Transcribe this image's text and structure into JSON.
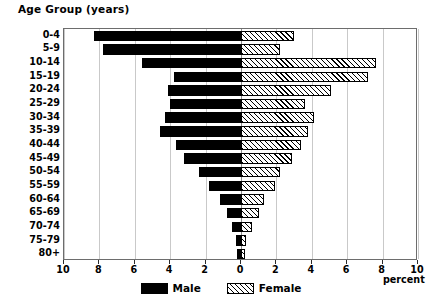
{
  "chart_data": {
    "type": "bar",
    "subtype": "population-pyramid",
    "title": "Age Group (years)",
    "xlabel": "percent",
    "ylabel": "Age Group (years)",
    "grid": true,
    "legend_position": "bottom-center",
    "x_axis": {
      "tick_labels": [
        "10",
        "8",
        "6",
        "4",
        "2",
        "0",
        "2",
        "4",
        "6",
        "8",
        "10"
      ],
      "tick_values": [
        -10,
        -8,
        -6,
        -4,
        -2,
        0,
        2,
        4,
        6,
        8,
        10
      ],
      "min": -10,
      "max": 10,
      "unit": "percent"
    },
    "categories": [
      "80+",
      "75-79",
      "70-74",
      "65-69",
      "60-64",
      "55-59",
      "50-54",
      "45-49",
      "40-44",
      "35-39",
      "30-34",
      "25-29",
      "20-24",
      "15-19",
      "10-14",
      "5-9",
      "0-4"
    ],
    "series": [
      {
        "name": "Male",
        "color": "#000000",
        "fill": "solid-black",
        "values": [
          0.2,
          0.3,
          0.5,
          0.8,
          1.2,
          1.8,
          2.4,
          3.2,
          3.7,
          4.6,
          4.3,
          4.0,
          4.1,
          3.8,
          5.6,
          7.8,
          8.3
        ]
      },
      {
        "name": "Female",
        "color": "#000000",
        "fill": "diagonal-hatch",
        "values": [
          0.2,
          0.3,
          0.6,
          1.0,
          1.3,
          1.9,
          2.2,
          2.9,
          3.4,
          3.8,
          4.1,
          3.6,
          5.1,
          7.2,
          7.6,
          2.2,
          3.0
        ]
      }
    ]
  },
  "chart": {
    "title": "Age Group (years)",
    "x_axis_title": "percent",
    "legend": [
      {
        "label": "Male",
        "swatch": "solid-black"
      },
      {
        "label": "Female",
        "swatch": "diagonal-hatch"
      }
    ]
  }
}
